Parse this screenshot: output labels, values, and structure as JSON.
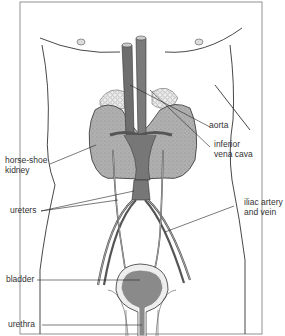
{
  "figure": {
    "colors": {
      "vessel": "#707070",
      "kidney": "#a8a8a8",
      "bladder": "#8a8a8a",
      "outline": "#333333",
      "background": "#ffffff"
    }
  },
  "labels": {
    "aorta": "aorta",
    "inferior_vena_cava": "inferior\nvena cava",
    "horse_shoe_kidney": "horse-shoe\nkidney",
    "ureters": "ureters",
    "iliac": "iliac artery\nand vein",
    "bladder": "bladder",
    "urethra": "urethra"
  }
}
